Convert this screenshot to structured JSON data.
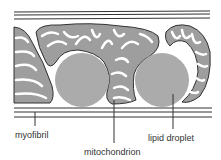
{
  "diagram": {
    "labels": {
      "myofibril": "myofibril",
      "mitochondrion": "mitochondrion",
      "lipid_droplet": "lipid droplet"
    },
    "colors": {
      "line": "#333333",
      "fill": "#9e9e9e",
      "droplet": "#ababab",
      "background": "#ffffff"
    }
  }
}
